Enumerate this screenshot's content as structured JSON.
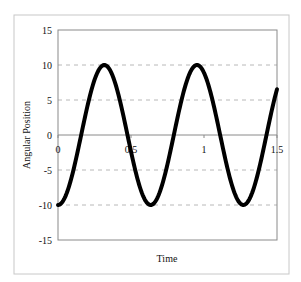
{
  "chart_data": {
    "type": "line",
    "title": "",
    "xlabel": "Time",
    "ylabel": "Angular Position",
    "xlim": [
      0,
      1.5
    ],
    "ylim": [
      -15,
      15
    ],
    "x_ticks": [
      0,
      0.5,
      1,
      1.5
    ],
    "x_tick_labels": [
      "0",
      "0.5",
      "1",
      "1.5"
    ],
    "y_ticks": [
      -15,
      -10,
      -5,
      0,
      5,
      10,
      15
    ],
    "y_tick_labels": [
      "-15",
      "-10",
      "-5",
      "0",
      "5",
      "10",
      "15"
    ],
    "grid": {
      "horizontal": true,
      "style": "dashed",
      "vertical": false
    },
    "legend": null,
    "series": [
      {
        "name": "Angular Position",
        "description": "Sinusoid approx. -10*cos(9.9*t); amplitude 10, period ~0.635",
        "color": "#000000",
        "x": [
          0,
          0.05,
          0.1,
          0.15,
          0.2,
          0.25,
          0.3,
          0.315,
          0.35,
          0.4,
          0.45,
          0.5,
          0.55,
          0.6,
          0.63,
          0.65,
          0.7,
          0.75,
          0.8,
          0.85,
          0.9,
          0.95,
          1.0,
          1.05,
          1.1,
          1.15,
          1.2,
          1.25,
          1.27,
          1.3,
          1.35,
          1.4,
          1.45,
          1.5
        ],
        "y": [
          -10,
          -8.8,
          -5.5,
          -0.7,
          3.9,
          7.8,
          9.9,
          10,
          9.5,
          7.0,
          3.0,
          -1.5,
          -5.9,
          -9.0,
          -10,
          -9.9,
          -9.0,
          -6.0,
          -1.5,
          3.0,
          7.2,
          9.6,
          9.9,
          8.0,
          4.1,
          -0.5,
          -5.1,
          -8.7,
          -9.8,
          -10,
          -8.8,
          -5.6,
          -1.0,
          6.7
        ]
      }
    ]
  },
  "axes": {
    "x_title": "Time",
    "y_title": "Angular Position"
  }
}
